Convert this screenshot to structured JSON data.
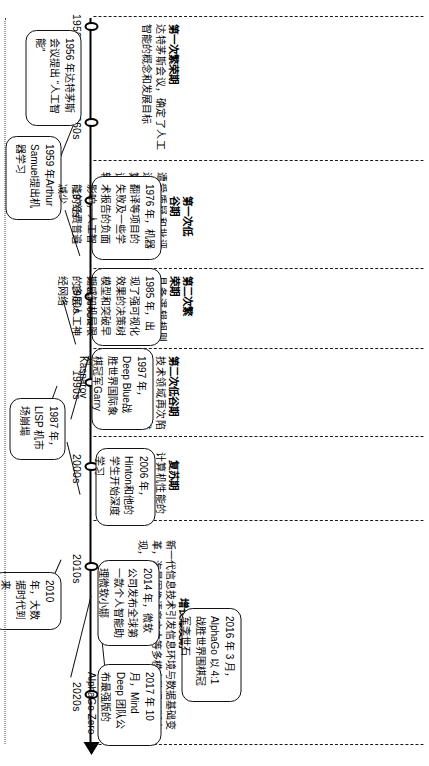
{
  "diagram": {
    "type": "timeline",
    "orientation": "rotated-90",
    "axis": {
      "name": "timeline-axis",
      "ticks": [
        "1950s",
        "1960s",
        "1970s",
        "1980s",
        "1990s",
        "2000s",
        "2010s",
        "2020s"
      ]
    }
  },
  "eras": [
    {
      "id": "era-1",
      "title": "第一次繁荣期",
      "desc": "达特茅斯会议，确定了人工智能的概念和发展目标"
    },
    {
      "id": "era-2",
      "title": "第一次低谷期",
      "desc": "遭受质疑和批评，运算能力不足，计算复杂度较高，常识与推理实现难度较大等"
    },
    {
      "id": "era-3",
      "title": "第二次繁荣期",
      "desc": "具备逻辑规则推演和特定领域回答问题的专家系统盛行，及五代计算机的发展"
    },
    {
      "id": "era-4",
      "title": "第二次低谷期",
      "desc": "技术领域再次陷入瓶颈，抽象推理不再被继续关注，基于符号处理的模型遭到反对"
    },
    {
      "id": "era-5",
      "title": "复苏期",
      "desc": "计算机性能的提升与互联网技术的快速普及"
    },
    {
      "id": "era-6",
      "title": "增长爆发期",
      "desc": "新一代信息技术引发信息环境与数据基础变革，海量图像语音文本等多模态数据不断出现，计算能力提高"
    }
  ],
  "events": [
    {
      "id": "event-1956",
      "text": "1956 年达特茅斯会议提出 “人工智能”"
    },
    {
      "id": "event-1959",
      "text": "1959 年Arthur Samuel提出机器学习"
    },
    {
      "id": "event-1976",
      "text": "1976 年，机器翻译等项目的失败及一些学术报告的负面影响，人工智能的经费普遍减少"
    },
    {
      "id": "event-1985",
      "text": "1985 年，出现了强可视化效果的决策树模型和突破早期感知机局限的多层人工神经网络"
    },
    {
      "id": "event-1987",
      "text": "1987 年，LISP 机市场崩塌"
    },
    {
      "id": "event-1997",
      "text": "1997 年，Deep Blue战胜世界国际象棋冠军Garry Kasparov"
    },
    {
      "id": "event-2006",
      "text": "2006 年，Hinton和他的学生开始深度学习"
    },
    {
      "id": "event-2010",
      "text": "2010 年，大数据时代到来"
    },
    {
      "id": "event-2014",
      "text": "2014 年，微软公司发布全球第一款个人智能助理微软小娜"
    },
    {
      "id": "event-2016",
      "text": "2016 年 3 月，AlphaGo 以 4:1 战胜世界围棋冠军李世石"
    },
    {
      "id": "event-2017",
      "text": "2017 年 10 月，Mind Deep 团队公布最强版的 AlphaGo Zero"
    }
  ],
  "colors": {
    "line": "#111111",
    "background": "#ffffff",
    "text": "#000000"
  }
}
